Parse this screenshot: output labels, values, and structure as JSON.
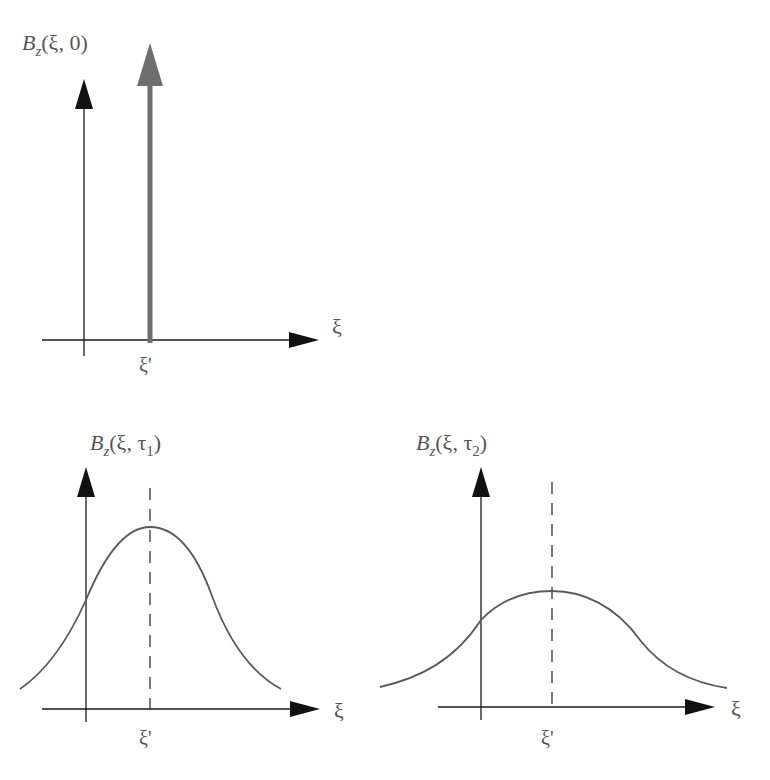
{
  "colors": {
    "axis": "#1a1a1a",
    "curve": "#5a5a5a",
    "delta": "#6e6e6e",
    "label": "#555555",
    "background": "#ffffff"
  },
  "panels": [
    {
      "id": "initial",
      "ylabel": {
        "symbol": "B",
        "subscript": "z",
        "args_open": "(ξ, ",
        "time": "0",
        "time_sub": "",
        "close": ")"
      },
      "xlabel": "ξ",
      "tick_label": "ξ'",
      "shape": "delta-function"
    },
    {
      "id": "tau1",
      "ylabel": {
        "symbol": "B",
        "subscript": "z",
        "args_open": "(ξ, ",
        "time": "τ",
        "time_sub": "1",
        "close": ")"
      },
      "xlabel": "ξ",
      "tick_label": "ξ'",
      "shape": "narrow-gaussian"
    },
    {
      "id": "tau2",
      "ylabel": {
        "symbol": "B",
        "subscript": "z",
        "args_open": "(ξ, ",
        "time": "τ",
        "time_sub": "2",
        "close": ")"
      },
      "xlabel": "ξ",
      "tick_label": "ξ'",
      "shape": "wide-gaussian"
    }
  ]
}
